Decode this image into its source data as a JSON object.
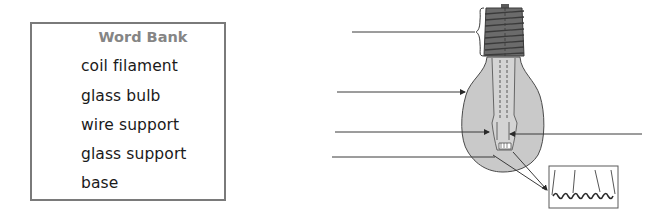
{
  "word_bank": {
    "title": "Word Bank",
    "items": [
      {
        "label": "coil filament"
      },
      {
        "label": "glass bulb"
      },
      {
        "label": "wire support"
      },
      {
        "label": "glass support"
      },
      {
        "label": "base"
      }
    ]
  },
  "diagram": {
    "label_lines": [
      {
        "id": "line-1",
        "target": "base (brace)",
        "answer_blank": ""
      },
      {
        "id": "line-2",
        "target": "glass bulb (arrow)",
        "answer_blank": ""
      },
      {
        "id": "line-3",
        "target": "wire support (arrows, left and right)",
        "answer_blank": ""
      },
      {
        "id": "line-4",
        "target": "glass support",
        "answer_blank": ""
      }
    ],
    "inset": "magnified coil filament",
    "colors": {
      "bulb_fill": "#c9c9c9",
      "base_fill": "#6b6b6b",
      "line": "#3a3a3a",
      "border": "#7a7a7a"
    }
  }
}
